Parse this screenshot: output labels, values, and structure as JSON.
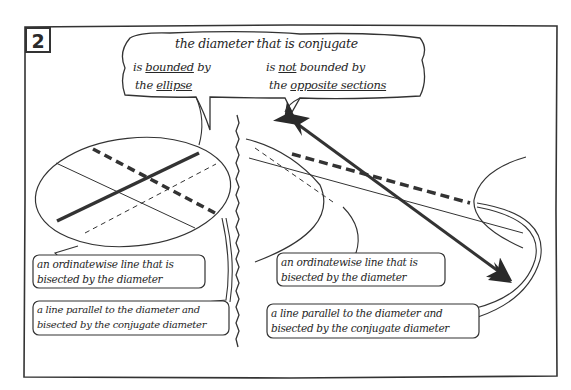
{
  "panel": {
    "number": "2"
  },
  "top_bubble": {
    "title": "the diameter that is conjugate",
    "left": {
      "line1_a": "is ",
      "line1_u": "bounded",
      "line1_b": " by",
      "line2_a": "the ",
      "line2_u": "ellipse"
    },
    "right": {
      "line1_a": "is ",
      "line1_u": "not",
      "line1_b": " bounded by",
      "line2_a": "the ",
      "line2_u": "opposite sections"
    }
  },
  "left_panel": {
    "figure": "ellipse",
    "callout_ordinate": {
      "line1": "an ordinatewise line that is",
      "line2": "bisected by the diameter"
    },
    "callout_parallel": {
      "line1": "a line parallel to the diameter and",
      "line2": "bisected by the conjugate diameter"
    }
  },
  "right_panel": {
    "figure": "opposite sections (hyperbola)",
    "callout_ordinate": {
      "line1": "an ordinatewise line that is",
      "line2": "bisected by the diameter"
    },
    "callout_parallel": {
      "line1": "a line parallel to the diameter and",
      "line2": "bisected by the conjugate diameter"
    }
  },
  "colors": {
    "ink": "#2a2a2a",
    "paper": "#ffffff"
  }
}
